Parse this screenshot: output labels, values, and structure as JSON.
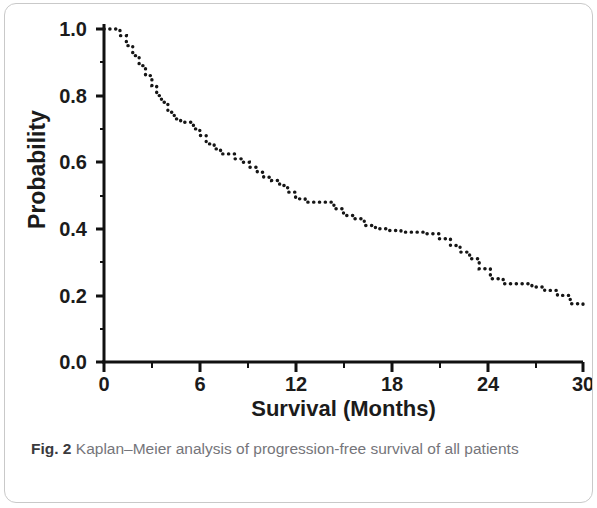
{
  "figure": {
    "caption_label": "Fig. 2",
    "caption_text": "Kaplan–Meier analysis of progression-free survival of all patients"
  },
  "chart_data": {
    "type": "line",
    "title": "",
    "subtitle": "",
    "xlabel": "Survival (Months)",
    "ylabel": "Probability",
    "xlim": [
      0,
      30
    ],
    "ylim": [
      0.0,
      1.0
    ],
    "xticks": [
      0,
      6,
      12,
      18,
      24,
      30
    ],
    "xtick_labels": [
      "0",
      "6",
      "12",
      "18",
      "24",
      "30"
    ],
    "yticks": [
      0.0,
      0.2,
      0.4,
      0.6,
      0.8,
      1.0
    ],
    "ytick_labels": [
      "0.0",
      "0.2",
      "0.4",
      "0.6",
      "0.8",
      "1.0"
    ],
    "grid": false,
    "legend": null,
    "line_style": "dotted",
    "line_color": "#161616",
    "series": [
      {
        "name": "Progression-free survival",
        "step": "post",
        "x": [
          0.0,
          0.5,
          1.0,
          1.4,
          1.8,
          2.2,
          2.6,
          3.0,
          3.3,
          3.6,
          4.0,
          4.4,
          4.8,
          5.2,
          5.6,
          6.0,
          6.4,
          6.9,
          7.3,
          7.8,
          8.2,
          8.7,
          9.1,
          9.6,
          10.0,
          10.5,
          11.0,
          11.5,
          12.0,
          12.6,
          13.2,
          13.8,
          14.4,
          15.0,
          15.6,
          16.3,
          17.0,
          17.8,
          18.6,
          19.4,
          20.2,
          21.0,
          21.7,
          22.3,
          22.9,
          23.5,
          24.2,
          25.0,
          25.9,
          26.8,
          27.6,
          28.4,
          29.2,
          30.0
        ],
        "y": [
          1.0,
          1.0,
          0.98,
          0.95,
          0.92,
          0.89,
          0.86,
          0.83,
          0.8,
          0.78,
          0.75,
          0.73,
          0.72,
          0.72,
          0.7,
          0.68,
          0.655,
          0.64,
          0.625,
          0.625,
          0.61,
          0.6,
          0.585,
          0.57,
          0.555,
          0.545,
          0.53,
          0.51,
          0.49,
          0.48,
          0.48,
          0.48,
          0.46,
          0.44,
          0.43,
          0.41,
          0.4,
          0.395,
          0.39,
          0.39,
          0.385,
          0.37,
          0.35,
          0.33,
          0.31,
          0.28,
          0.25,
          0.235,
          0.235,
          0.225,
          0.215,
          0.2,
          0.175,
          0.17
        ]
      }
    ]
  }
}
